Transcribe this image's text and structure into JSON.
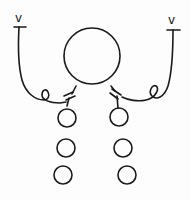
{
  "diagram": {
    "style": "hand-drawn line sketch",
    "colors": {
      "stroke": "#1a1a1a",
      "background": "#fdfdfd"
    },
    "central_node": {
      "shape": "circle",
      "label": ""
    },
    "arms": [
      {
        "side": "left",
        "terminal_mark": "v",
        "terminal_bar": "T",
        "linker": "curly loop",
        "joint": "double bar",
        "chain_nodes": 3
      },
      {
        "side": "right",
        "terminal_mark": "v",
        "terminal_bar": "T",
        "linker": "curly loop",
        "joint": "double bar",
        "chain_nodes": 3
      }
    ],
    "labels": {
      "left_terminal": "v",
      "right_terminal": "v"
    }
  }
}
